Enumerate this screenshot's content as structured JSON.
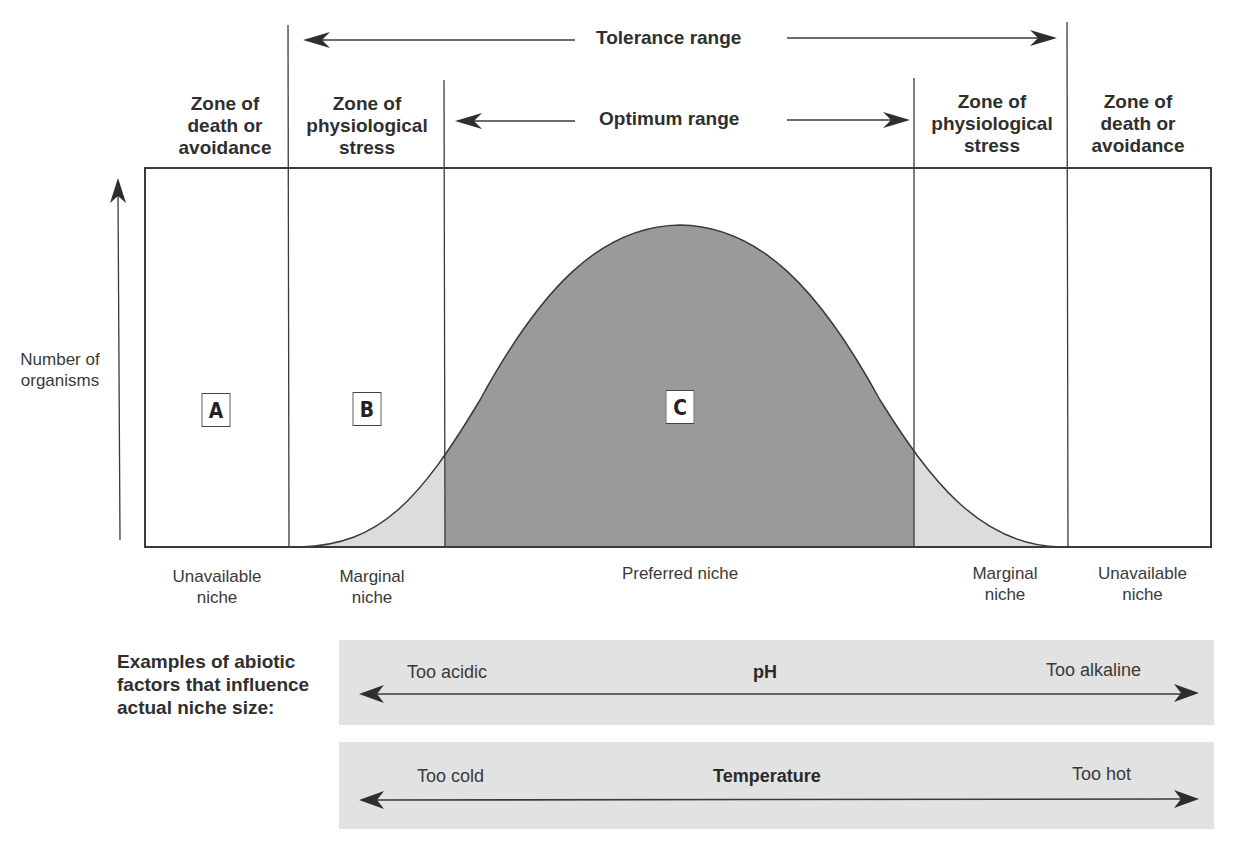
{
  "header": {
    "tolerance_range": "Tolerance range",
    "optimum_range": "Optimum range"
  },
  "zones": [
    {
      "id": "left-death",
      "label_lines": [
        "Zone of",
        "death or",
        "avoidance"
      ]
    },
    {
      "id": "left-stress",
      "label_lines": [
        "Zone of",
        "physiological",
        "stress"
      ]
    },
    {
      "id": "right-stress",
      "label_lines": [
        "Zone of",
        "physiological",
        "stress"
      ]
    },
    {
      "id": "right-death",
      "label_lines": [
        "Zone of",
        "death or",
        "avoidance"
      ]
    }
  ],
  "y_axis": {
    "label_lines": [
      "Number of",
      "organisms"
    ]
  },
  "region_markers": [
    "A",
    "B",
    "C"
  ],
  "niches": [
    {
      "id": "unavailable-left",
      "label_lines": [
        "Unavailable",
        "niche"
      ]
    },
    {
      "id": "marginal-left",
      "label_lines": [
        "Marginal",
        "niche"
      ]
    },
    {
      "id": "preferred",
      "label_lines": [
        "Preferred niche"
      ]
    },
    {
      "id": "marginal-right",
      "label_lines": [
        "Marginal",
        "niche"
      ]
    },
    {
      "id": "unavailable-right",
      "label_lines": [
        "Unavailable",
        "niche"
      ]
    }
  ],
  "examples": {
    "label_lines": [
      "Examples of abiotic",
      "factors that influence",
      "actual niche size:"
    ],
    "factors": [
      {
        "name": "pH",
        "left": "Too acidic",
        "right": "Too alkaline"
      },
      {
        "name": "Temperature",
        "left": "Too cold",
        "right": "Too hot"
      }
    ]
  },
  "colors": {
    "preferred_fill": "#9a9a9a",
    "marginal_fill": "#dcdcdc",
    "factor_bar": "#e2e2e2",
    "line": "#3a3a3a"
  }
}
